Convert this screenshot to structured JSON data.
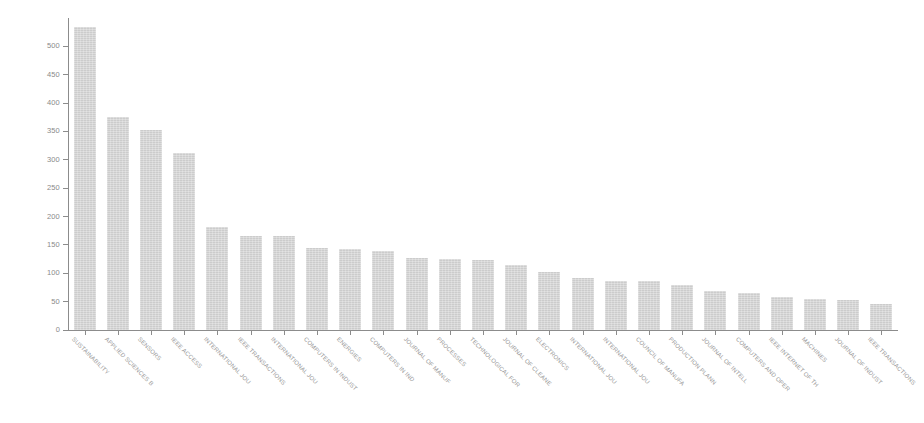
{
  "chart_data": {
    "type": "bar",
    "title": "",
    "subtitle": "",
    "xlabel": "",
    "ylabel": "",
    "ylim": [
      0,
      550
    ],
    "grid": false,
    "legend": "none",
    "orientation": "vertical",
    "bar_color": "#c8c8c8",
    "axis_color": "#8c8c8c",
    "tick_label_color": "#8a8a8a",
    "yticks": [
      0,
      50,
      100,
      150,
      200,
      250,
      300,
      350,
      400,
      450,
      500
    ],
    "ytick_labels": [
      "0",
      "50",
      "100",
      "150",
      "200",
      "250",
      "300",
      "350",
      "400",
      "450",
      "500"
    ],
    "categories": [
      "SUSTAINABILITY",
      "APPLIED SCIENCES B",
      "SENSORS",
      "IEEE ACCESS",
      "INTERNATIONAL JOU",
      "IEEE TRANSACTIONS",
      "INTERNATIONAL JOU",
      "COMPUTERS IN INDUST",
      "ENERGIES",
      "COMPUTERS IN IND",
      "JOURNAL OF MANUF",
      "PROCESSES",
      "TECHNOLOGICAL FOR",
      "JOURNAL OF CLEANE",
      "ELECTRONICS",
      "INTERNATIONAL JOU",
      "INTERNATIONAL JOU",
      "COUNCIL OF MANUFA",
      "PRODUCTION PLANN",
      "JOURNAL OF INTELL",
      "COMPUTERS AND OPER",
      "IEEE INTERNET OF TH",
      "MACHINES",
      "JOURNAL OF INDUST",
      "IEEE TRANSACTIONS"
    ],
    "values": [
      535,
      375,
      353,
      312,
      181,
      166,
      165,
      144,
      143,
      139,
      127,
      125,
      123,
      114,
      102,
      91,
      87,
      86,
      79,
      69,
      65,
      59,
      55,
      53,
      46
    ]
  }
}
